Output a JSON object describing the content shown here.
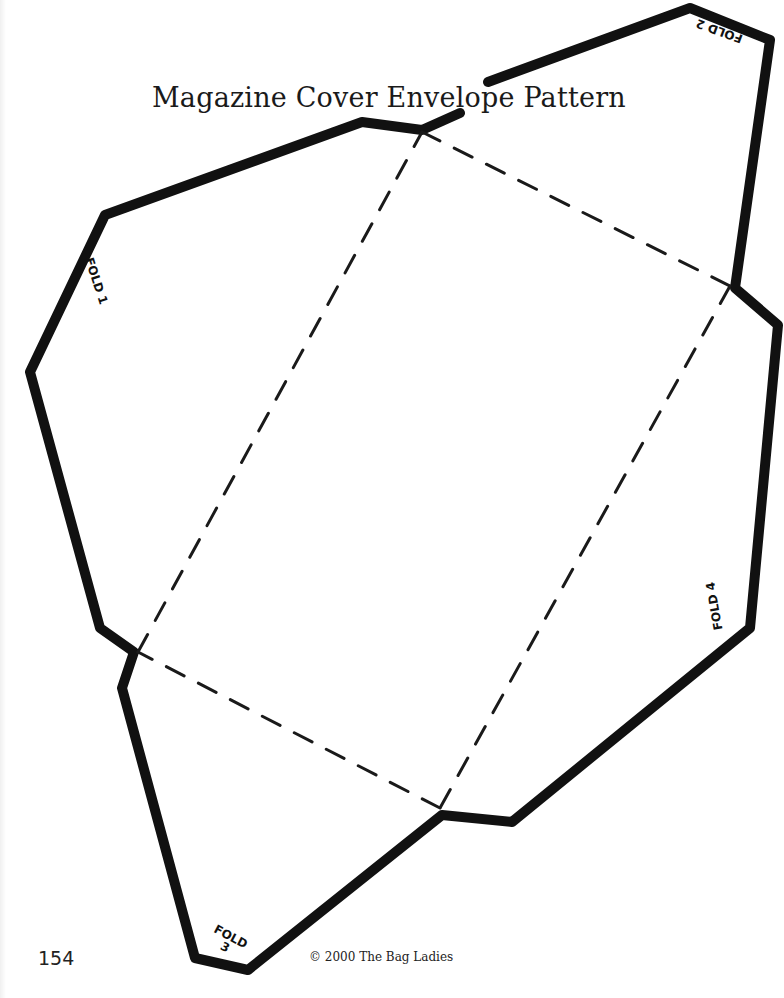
{
  "document": {
    "title": "Magazine Cover Envelope Pattern",
    "page_number": "154",
    "copyright": "© 2000 The Bag Ladies"
  },
  "fold_labels": {
    "fold1": {
      "text": "FOLD 1"
    },
    "fold2": {
      "text": "FOLD 2"
    },
    "fold3": {
      "word": "FOLD",
      "num": "3"
    },
    "fold4": {
      "text": "FOLD 4"
    }
  },
  "colors": {
    "outline": "#111111",
    "dashes": "#1a1a1a",
    "background": "#ffffff"
  }
}
